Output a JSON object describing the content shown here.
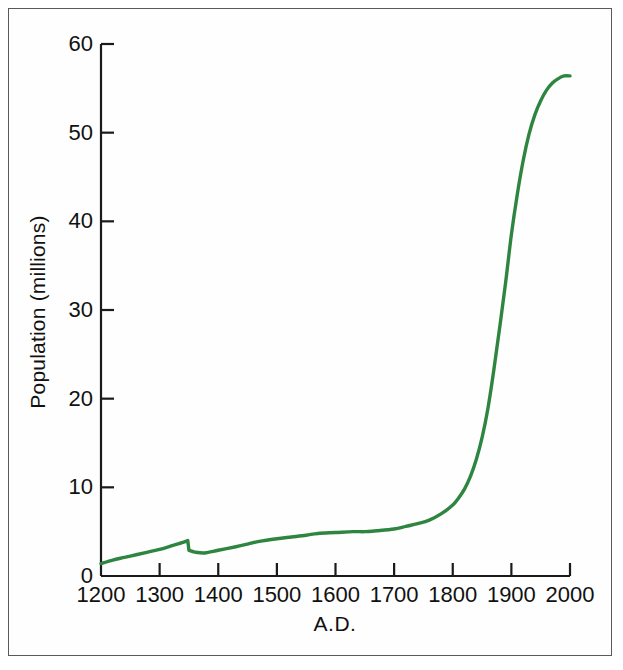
{
  "figure": {
    "background_color": "#ffffff",
    "frame_color": "#5a5a5a"
  },
  "chart_data": {
    "type": "line",
    "title": "",
    "subtitle": "",
    "xlabel": "A.D.",
    "ylabel": "Population (millions)",
    "xlim": [
      1200,
      2000
    ],
    "ylim": [
      0,
      60
    ],
    "xticks": [
      1200,
      1300,
      1400,
      1500,
      1600,
      1700,
      1800,
      1900,
      2000
    ],
    "xticklabels": [
      "1200",
      "1300",
      "1400",
      "1500",
      "1600",
      "1700",
      "1800",
      "1900",
      "2000"
    ],
    "yticks": [
      0,
      10,
      20,
      30,
      40,
      50,
      60
    ],
    "yticklabels": [
      "0",
      "10",
      "20",
      "30",
      "40",
      "50",
      "60"
    ],
    "grid": false,
    "legend": null,
    "legend_position": "none",
    "line_color": "#2e8540",
    "line_width": 3.4,
    "annotations": [],
    "series": [
      {
        "name": "Population",
        "x": [
          1200,
          1220,
          1240,
          1260,
          1280,
          1300,
          1320,
          1340,
          1348,
          1350,
          1360,
          1377,
          1400,
          1430,
          1450,
          1470,
          1500,
          1525,
          1550,
          1570,
          1600,
          1630,
          1650,
          1670,
          1700,
          1720,
          1740,
          1760,
          1780,
          1800,
          1810,
          1820,
          1830,
          1840,
          1850,
          1860,
          1870,
          1880,
          1890,
          1900,
          1910,
          1920,
          1930,
          1940,
          1950,
          1960,
          1970,
          1980,
          1990,
          2000
        ],
        "y": [
          1.4,
          1.8,
          2.1,
          2.4,
          2.7,
          3.0,
          3.4,
          3.8,
          4.0,
          2.9,
          2.7,
          2.6,
          2.9,
          3.3,
          3.6,
          3.9,
          4.2,
          4.4,
          4.6,
          4.8,
          4.9,
          5.0,
          5.0,
          5.1,
          5.3,
          5.6,
          5.9,
          6.3,
          7.0,
          8.0,
          8.8,
          9.8,
          11.2,
          13.1,
          15.6,
          18.9,
          23.2,
          28.0,
          33.0,
          38.5,
          43.0,
          46.8,
          49.8,
          52.0,
          53.6,
          54.8,
          55.6,
          56.1,
          56.4,
          56.4
        ]
      }
    ]
  }
}
